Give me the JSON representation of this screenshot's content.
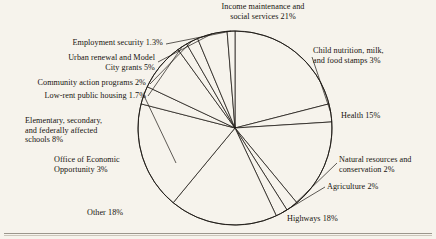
{
  "figure": {
    "kind": "pie-chart",
    "background": "#f6f3ec",
    "ink": "#1b1713",
    "center": {
      "x": 235,
      "y": 128
    },
    "radius": 97
  },
  "labels": {
    "income": "Income maintenance and\nsocial services 21%",
    "child": "Child nutrition, milk,\nand food stamps 3%",
    "health": "Health 15%",
    "natural": "Natural resources and\nconservation 2%",
    "agriculture": "Agriculture 2%",
    "highways": "Highways 18%",
    "other": "Other 18%",
    "oeo": "Office of Economic\nOpportunity 3%",
    "schools": "Elementary, secondary,\nand federally affected\nschools 8%",
    "lowrent": "Low-rent public housing 1.7%",
    "community": "Community action programs 2%",
    "urban": "Urban renewal and Model\nCity grants 5%",
    "employment": "Employment security 1.3%"
  },
  "chart_data": {
    "type": "pie",
    "title": "",
    "units": "percent",
    "start_angle_deg": 0,
    "direction": "clockwise",
    "total": 100,
    "legend": "none-labels-outside",
    "categories": [
      "Income maintenance and social services",
      "Child nutrition, milk, and food stamps",
      "Health",
      "Natural resources and conservation",
      "Agriculture",
      "Highways",
      "Other",
      "Office of Economic Opportunity",
      "Elementary, secondary, and federally affected schools",
      "Low-rent public housing",
      "Community action programs",
      "Urban renewal and Model City grants",
      "Employment security"
    ],
    "values": [
      21,
      3,
      15,
      2,
      2,
      18,
      18,
      3,
      8,
      1.7,
      2,
      5,
      1.3
    ],
    "value_labels": [
      "21%",
      "3%",
      "15%",
      "2%",
      "2%",
      "18%",
      "18%",
      "3%",
      "8%",
      "1.7%",
      "2%",
      "5%",
      "1.3%"
    ],
    "slice_fill": "#f6f3ec",
    "slice_stroke": "#1b1713"
  }
}
